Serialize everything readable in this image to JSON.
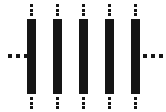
{
  "figure": {
    "canvas": {
      "width": 166,
      "height": 112,
      "background_color": "#ffffff"
    },
    "bar_color": "#151515",
    "dot_color": "#151515",
    "bar_count": 5,
    "bar_width": 9,
    "bar_top": 19,
    "bar_height": 75,
    "bar_pitch": 26,
    "bars": [
      {
        "index": 1,
        "x": 27,
        "y": 19,
        "width": 9,
        "height": 75,
        "color": "#151515"
      },
      {
        "index": 2,
        "x": 53,
        "y": 19,
        "width": 9,
        "height": 75,
        "color": "#151515"
      },
      {
        "index": 3,
        "x": 79,
        "y": 19,
        "width": 9,
        "height": 75,
        "color": "#151515"
      },
      {
        "index": 4,
        "x": 105,
        "y": 19,
        "width": 9,
        "height": 75,
        "color": "#151515"
      },
      {
        "index": 5,
        "x": 131,
        "y": 19,
        "width": 9,
        "height": 75,
        "color": "#151515"
      }
    ],
    "vertical_ellipses_top": [
      {
        "index": 1,
        "x": 27,
        "y": 4,
        "dot_count": 3,
        "glyph": "vertical-ellipsis"
      },
      {
        "index": 2,
        "x": 53,
        "y": 4,
        "dot_count": 3,
        "glyph": "vertical-ellipsis"
      },
      {
        "index": 3,
        "x": 79,
        "y": 4,
        "dot_count": 3,
        "glyph": "vertical-ellipsis"
      },
      {
        "index": 4,
        "x": 105,
        "y": 4,
        "dot_count": 3,
        "glyph": "vertical-ellipsis"
      },
      {
        "index": 5,
        "x": 131,
        "y": 4,
        "dot_count": 3,
        "glyph": "vertical-ellipsis"
      }
    ],
    "vertical_ellipses_bottom": [
      {
        "index": 1,
        "x": 27,
        "y": 97,
        "dot_count": 3,
        "glyph": "vertical-ellipsis"
      },
      {
        "index": 2,
        "x": 53,
        "y": 97,
        "dot_count": 3,
        "glyph": "vertical-ellipsis"
      },
      {
        "index": 3,
        "x": 79,
        "y": 97,
        "dot_count": 3,
        "glyph": "vertical-ellipsis"
      },
      {
        "index": 4,
        "x": 105,
        "y": 97,
        "dot_count": 3,
        "glyph": "vertical-ellipsis"
      },
      {
        "index": 5,
        "x": 131,
        "y": 97,
        "dot_count": 3,
        "glyph": "vertical-ellipsis"
      }
    ],
    "horizontal_ellipses": [
      {
        "side": "left",
        "x": 8,
        "y": 54,
        "width": 20,
        "dot_count": 3,
        "glyph": "horizontal-ellipsis"
      },
      {
        "side": "right",
        "x": 143,
        "y": 54,
        "width": 20,
        "dot_count": 3,
        "glyph": "horizontal-ellipsis"
      }
    ]
  }
}
